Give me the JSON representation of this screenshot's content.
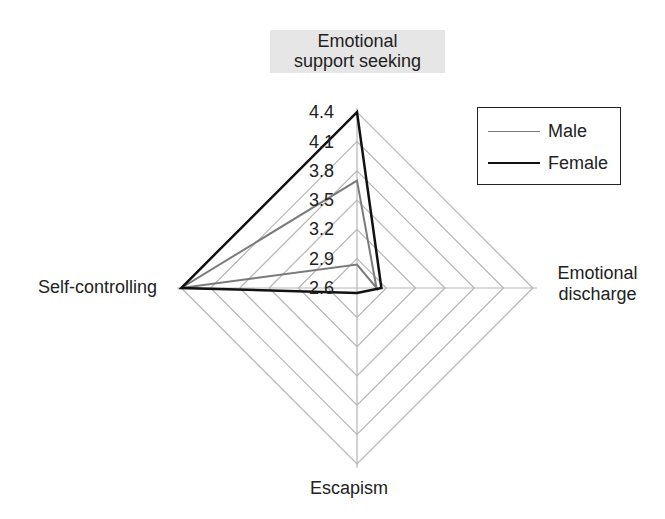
{
  "chart_data": {
    "type": "radar",
    "title": "",
    "axes": [
      "Emotional support seeking",
      "Emotional discharge",
      "Escapism",
      "Self-controlling"
    ],
    "axis_label_lines": {
      "top": [
        "Emotional",
        "support seeking"
      ],
      "right": [
        "Emotional",
        "discharge"
      ],
      "bottom": [
        "Escapism"
      ],
      "left": [
        "Self-controlling"
      ]
    },
    "scale": {
      "min": 2.6,
      "max": 4.4,
      "step": 0.3
    },
    "tick_labels": [
      "4.4",
      "4.1",
      "3.8",
      "3.5",
      "3.2",
      "2.9",
      "2.6"
    ],
    "series": [
      {
        "name": "Male",
        "color": "#7a7a7a",
        "width": 2,
        "values": [
          3.7,
          2.8,
          2.36,
          4.4
        ]
      },
      {
        "name": "Female",
        "color": "#111111",
        "width": 2.5,
        "values": [
          4.4,
          2.85,
          2.65,
          4.4
        ]
      }
    ],
    "legend": {
      "position": "top-right",
      "entries": [
        "Male",
        "Female"
      ]
    },
    "grid": {
      "rings": 6,
      "shape": "diamond",
      "color": "#b5b5b5"
    }
  },
  "colors": {
    "grid": "#b5b5b5",
    "title_box_bg": "#e6e6e6",
    "male": "#7a7a7a",
    "female": "#111111"
  }
}
